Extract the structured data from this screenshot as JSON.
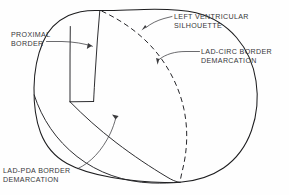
{
  "figure": {
    "background_color": "#fefefe",
    "line_color": "#1d1d1f",
    "text_color": "#37373a"
  },
  "labels": {
    "left_ventricular_silhouette": "LEFT VENTRICULAR\nSILHOUETTE",
    "lad_circ_border_demarcation": "LAD-CIRC BORDER\nDEMARCATION",
    "proximal_border": "PROXIMAL\nBORDER",
    "lad_pda_border_demarcation": "LAD-PDA BORDER\nDEMARCATION"
  },
  "elements": {
    "silhouette_outline": "left-ventricular-silhouette-outline",
    "proximal_border_line": "proximal-border-vertical-line",
    "lad_pda_border_line": "lad-pda-border-curve",
    "lad_circ_border_line": "lad-circ-border-dashed-curve"
  }
}
